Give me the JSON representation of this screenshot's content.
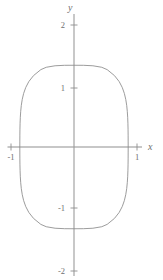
{
  "figure": {
    "title": "",
    "background_color": "#ffffff",
    "width": 163,
    "height": 280
  },
  "axes": {
    "x": {
      "name": "x",
      "tick_labels": [
        "-1",
        "1"
      ],
      "tick_values": [
        -1,
        1
      ],
      "range": [
        -1.12,
        1.2
      ],
      "color": "#8a8a8a"
    },
    "y": {
      "name": "y",
      "tick_labels": [
        "2",
        "1",
        "-1",
        "-2"
      ],
      "tick_values": [
        2,
        1,
        -1,
        -2
      ],
      "range": [
        -2.2,
        2.2
      ],
      "color": "#8a8a8a"
    },
    "origin_label": ""
  },
  "chart_data": {
    "type": "line",
    "title": "",
    "subtitle": "",
    "xlabel": "x",
    "ylabel": "y",
    "xlim": [
      -1.12,
      1.2
    ],
    "ylim": [
      -2.2,
      2.2
    ],
    "grid": false,
    "legend": [],
    "legend_position": "none",
    "xticks": [
      -1,
      1
    ],
    "xticklabels": [
      "-1",
      "1"
    ],
    "yticks": [
      2,
      1,
      -1,
      -2
    ],
    "yticklabels": [
      "2",
      "1",
      "-1",
      "-2"
    ],
    "curve_color": "#8a8a8a",
    "curve_width": 0.8,
    "closed": true,
    "extent_x": [
      -0.86,
      0.86
    ],
    "extent_y": [
      -1.37,
      1.37
    ],
    "series": [
      {
        "name": "closed-curve",
        "closed": true,
        "points": [
          [
            0.86,
            0.0
          ],
          [
            0.8598,
            0.1
          ],
          [
            0.8592,
            0.2
          ],
          [
            0.858,
            0.3
          ],
          [
            0.8558,
            0.4
          ],
          [
            0.852,
            0.5
          ],
          [
            0.8459,
            0.6
          ],
          [
            0.8363,
            0.7
          ],
          [
            0.8216,
            0.8
          ],
          [
            0.7995,
            0.9
          ],
          [
            0.7664,
            1.0
          ],
          [
            0.717,
            1.1
          ],
          [
            0.6425,
            1.2
          ],
          [
            0.5268,
            1.3
          ],
          [
            0.4405,
            1.34
          ],
          [
            0.3,
            1.365
          ],
          [
            0.15,
            1.373
          ],
          [
            0.0,
            1.374
          ],
          [
            -0.15,
            1.373
          ],
          [
            -0.3,
            1.365
          ],
          [
            -0.4405,
            1.34
          ],
          [
            -0.5268,
            1.3
          ],
          [
            -0.6425,
            1.2
          ],
          [
            -0.717,
            1.1
          ],
          [
            -0.7664,
            1.0
          ],
          [
            -0.7995,
            0.9
          ],
          [
            -0.8216,
            0.8
          ],
          [
            -0.8363,
            0.7
          ],
          [
            -0.8459,
            0.6
          ],
          [
            -0.852,
            0.5
          ],
          [
            -0.8558,
            0.4
          ],
          [
            -0.858,
            0.3
          ],
          [
            -0.8592,
            0.2
          ],
          [
            -0.8598,
            0.1
          ],
          [
            -0.86,
            0.0
          ],
          [
            -0.8598,
            -0.1
          ],
          [
            -0.8592,
            -0.2
          ],
          [
            -0.858,
            -0.3
          ],
          [
            -0.8558,
            -0.4
          ],
          [
            -0.852,
            -0.5
          ],
          [
            -0.8459,
            -0.6
          ],
          [
            -0.8363,
            -0.7
          ],
          [
            -0.8216,
            -0.8
          ],
          [
            -0.7995,
            -0.9
          ],
          [
            -0.7664,
            -1.0
          ],
          [
            -0.717,
            -1.1
          ],
          [
            -0.6425,
            -1.2
          ],
          [
            -0.5268,
            -1.3
          ],
          [
            -0.4405,
            -1.34
          ],
          [
            -0.3,
            -1.365
          ],
          [
            -0.15,
            -1.373
          ],
          [
            0.0,
            -1.374
          ],
          [
            0.15,
            -1.373
          ],
          [
            0.3,
            -1.365
          ],
          [
            0.4405,
            -1.34
          ],
          [
            0.5268,
            -1.3
          ],
          [
            0.6425,
            -1.2
          ],
          [
            0.717,
            -1.1
          ],
          [
            0.7664,
            -1.0
          ],
          [
            0.7995,
            -0.9
          ],
          [
            0.8216,
            -0.8
          ],
          [
            0.8363,
            -0.7
          ],
          [
            0.8459,
            -0.6
          ],
          [
            0.852,
            -0.5
          ],
          [
            0.8558,
            -0.4
          ],
          [
            0.858,
            -0.3
          ],
          [
            0.8592,
            -0.2
          ],
          [
            0.8598,
            -0.1
          ],
          [
            0.86,
            0.0
          ]
        ]
      }
    ]
  }
}
